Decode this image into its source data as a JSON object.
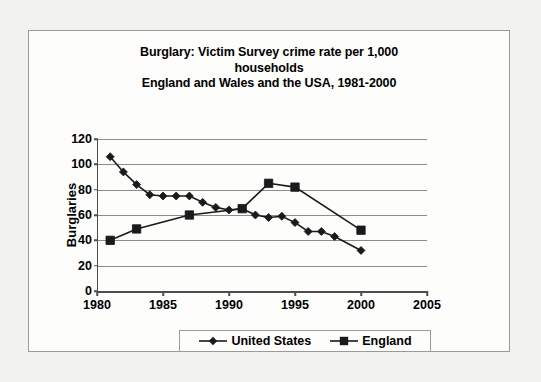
{
  "chart_data": {
    "type": "line",
    "title": "Burglary: Victim Survey crime rate per 1,000 households\nEngland and Wales and the USA, 1981-2000",
    "title_lines": [
      "Burglary: Victim Survey crime rate per 1,000",
      "households",
      "England and Wales and the USA, 1981-2000"
    ],
    "xlabel": "",
    "ylabel": "Burglaries",
    "xlim": [
      1980,
      2005
    ],
    "ylim": [
      0,
      120
    ],
    "xticks": [
      1980,
      1985,
      1990,
      1995,
      2000,
      2005
    ],
    "yticks": [
      0,
      20,
      40,
      60,
      80,
      100,
      120
    ],
    "grid": "horizontal",
    "legend_position": "bottom",
    "series": [
      {
        "name": "United States",
        "marker": "diamond",
        "color": "#1a1a1a",
        "x": [
          1981,
          1982,
          1983,
          1984,
          1985,
          1986,
          1987,
          1988,
          1989,
          1990,
          1991,
          1992,
          1993,
          1994,
          1995,
          1996,
          1997,
          1998,
          2000
        ],
        "values": [
          106,
          94,
          84,
          76,
          75,
          75,
          75,
          70,
          66,
          64,
          65,
          60,
          58,
          59,
          54,
          47,
          47,
          43,
          32
        ]
      },
      {
        "name": "England",
        "marker": "square",
        "color": "#1a1a1a",
        "x": [
          1981,
          1983,
          1987,
          1991,
          1993,
          1995,
          2000
        ],
        "values": [
          40,
          49,
          60,
          65,
          85,
          82,
          48
        ]
      }
    ]
  },
  "legend": {
    "entries": [
      {
        "label": "United States",
        "marker": "diamond"
      },
      {
        "label": "England",
        "marker": "square"
      }
    ]
  }
}
